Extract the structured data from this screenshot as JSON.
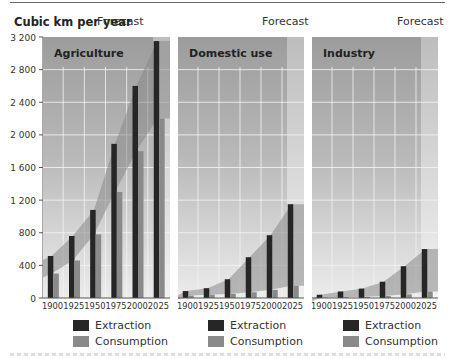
{
  "chart_data": {
    "type": "bar",
    "title": "",
    "ylabel": "Cubic km per year",
    "xlabel": "",
    "ylim": [
      0,
      3200
    ],
    "yticks": [
      0,
      400,
      800,
      1200,
      1600,
      2000,
      2400,
      2800,
      3200
    ],
    "ytick_labels": [
      "0",
      "400",
      "800",
      "1 200",
      "1 600",
      "2 000",
      "2 400",
      "2 800",
      "3 200"
    ],
    "categories": [
      "1900",
      "1925",
      "1950",
      "1975",
      "2000",
      "2025"
    ],
    "forecast_label": "Forecast",
    "forecast_from": "2025",
    "grid": true,
    "legend_position": "bottom",
    "panels": [
      {
        "name": "Agriculture",
        "series": [
          {
            "name": "Extraction",
            "values": [
              515,
              760,
              1080,
              1890,
              2600,
              3150
            ]
          },
          {
            "name": "Consumption",
            "values": [
              300,
              460,
              780,
              1300,
              1800,
              2200
            ]
          }
        ]
      },
      {
        "name": "Domestic use",
        "series": [
          {
            "name": "Extraction",
            "values": [
              85,
              120,
              230,
              500,
              770,
              1150
            ]
          },
          {
            "name": "Consumption",
            "values": [
              30,
              40,
              50,
              70,
              100,
              150
            ]
          }
        ]
      },
      {
        "name": "Industry",
        "series": [
          {
            "name": "Extraction",
            "values": [
              40,
              80,
              115,
              200,
              390,
              600
            ]
          },
          {
            "name": "Consumption",
            "values": [
              5,
              10,
              15,
              25,
              45,
              80
            ]
          }
        ]
      }
    ]
  },
  "header": {
    "unit_label": "Cubic km per year",
    "forecast_labels": [
      "Forecast",
      "Forecast",
      "Forecast"
    ]
  },
  "legend": {
    "extraction": "Extraction",
    "consumption": "Consumption"
  },
  "colors": {
    "extraction": "#262626",
    "consumption": "#8a8a8a",
    "band": "#888888",
    "bg_top": "#9c9c9c",
    "bg_bottom": "#ececec",
    "forecast_top": "#bdbdbd",
    "forecast_bottom": "#f2f2f2",
    "grid": "#f4f4f4"
  }
}
